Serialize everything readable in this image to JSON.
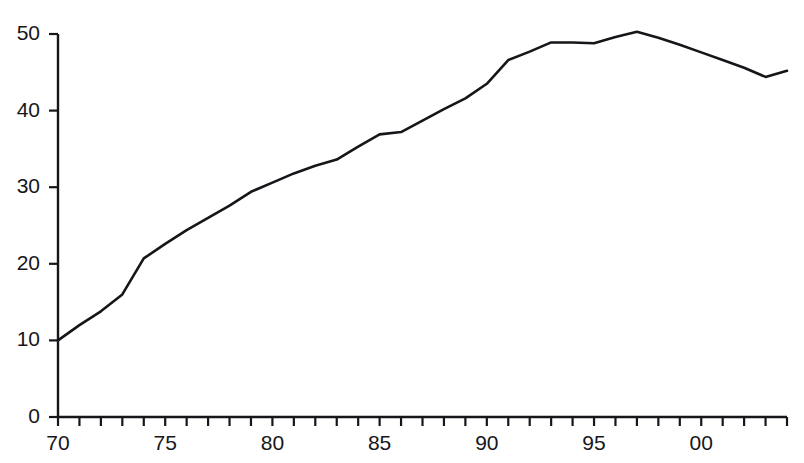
{
  "header": {
    "clipped_text": "— — —— —— —  —  — — —  — — —"
  },
  "axes": {
    "y_ticks": [
      "0",
      "10",
      "20",
      "30",
      "40",
      "50"
    ],
    "x_ticks": [
      "70",
      "75",
      "80",
      "85",
      "90",
      "95",
      "00"
    ],
    "xlabel": "",
    "ylabel": "",
    "axis_color": "#16161a"
  },
  "chart_data": {
    "type": "line",
    "title": "",
    "subtitle": "",
    "xlabel": "",
    "ylabel": "",
    "xlim": [
      1970,
      2004
    ],
    "ylim": [
      0,
      50
    ],
    "grid": false,
    "legend": null,
    "axis_style": "bottom-left spine with outward ticks",
    "line_color": "#16161a",
    "line_width": 2.6,
    "x_tick_interval": 1,
    "x_label_interval": 5,
    "y_tick_interval": 10,
    "x_tick_labels": {
      "1970": "70",
      "1975": "75",
      "1980": "80",
      "1985": "85",
      "1990": "90",
      "1995": "95",
      "2000": "00"
    },
    "x": [
      1970,
      1971,
      1972,
      1973,
      1974,
      1975,
      1976,
      1977,
      1978,
      1979,
      1980,
      1981,
      1982,
      1983,
      1984,
      1985,
      1986,
      1987,
      1988,
      1989,
      1990,
      1991,
      1992,
      1993,
      1994,
      1995,
      1996,
      1997,
      1998,
      1999,
      2000,
      2001,
      2002,
      2003,
      2004
    ],
    "values": [
      10.0,
      12.0,
      13.8,
      16.0,
      20.7,
      22.6,
      24.4,
      26.0,
      27.6,
      29.4,
      30.6,
      31.8,
      32.8,
      33.6,
      35.3,
      36.9,
      37.2,
      38.7,
      40.2,
      41.6,
      43.5,
      46.6,
      47.7,
      48.9,
      48.9,
      48.8,
      49.6,
      50.3,
      49.5,
      48.6,
      47.6,
      46.6,
      45.6,
      44.4,
      45.2
    ],
    "series": [
      {
        "name": "series-1",
        "values": [
          10.0,
          12.0,
          13.8,
          16.0,
          20.7,
          22.6,
          24.4,
          26.0,
          27.6,
          29.4,
          30.6,
          31.8,
          32.8,
          33.6,
          35.3,
          36.9,
          37.2,
          38.7,
          40.2,
          41.6,
          43.5,
          46.6,
          47.7,
          48.9,
          48.9,
          48.8,
          49.6,
          50.3,
          49.5,
          48.6,
          47.6,
          46.6,
          45.6,
          44.4,
          45.2
        ]
      }
    ],
    "annotations": [
      {
        "label": "start",
        "x": 1970,
        "y": 10.0
      },
      {
        "label": "peak",
        "x": 1997,
        "y": 50.3
      },
      {
        "label": "trough-late",
        "x": 2003,
        "y": 44.4
      },
      {
        "label": "end",
        "x": 2004,
        "y": 45.2
      }
    ]
  }
}
